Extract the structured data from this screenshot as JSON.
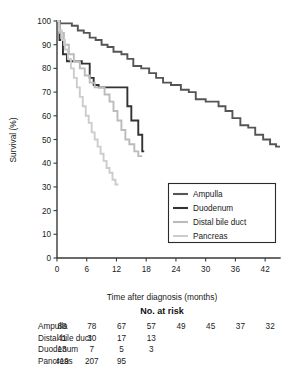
{
  "chart_data": {
    "type": "line",
    "title": "",
    "xlabel": "Time after diagnosis (months)",
    "ylabel": "Survival (%)",
    "xlim": [
      0,
      45
    ],
    "ylim": [
      0,
      100
    ],
    "xticks": [
      0,
      6,
      12,
      18,
      24,
      30,
      36,
      42
    ],
    "yticks": [
      0,
      10,
      20,
      30,
      40,
      50,
      60,
      70,
      80,
      90,
      100
    ],
    "grid": false,
    "legend_position": "center-right",
    "series": [
      {
        "name": "Ampulla",
        "color": "#555555",
        "points": [
          [
            0,
            100
          ],
          [
            0.6,
            100
          ],
          [
            0.6,
            99
          ],
          [
            3.0,
            99
          ],
          [
            3.0,
            98
          ],
          [
            4.2,
            98
          ],
          [
            4.2,
            96
          ],
          [
            5.4,
            96
          ],
          [
            5.4,
            95
          ],
          [
            6.6,
            95
          ],
          [
            6.6,
            93
          ],
          [
            7.8,
            93
          ],
          [
            7.8,
            92
          ],
          [
            9.0,
            92
          ],
          [
            9.0,
            90
          ],
          [
            10.2,
            90
          ],
          [
            10.2,
            89
          ],
          [
            11.4,
            89
          ],
          [
            11.4,
            87
          ],
          [
            13.0,
            87
          ],
          [
            13.0,
            86
          ],
          [
            14.2,
            86
          ],
          [
            14.2,
            84
          ],
          [
            15.4,
            84
          ],
          [
            15.4,
            81
          ],
          [
            17.0,
            81
          ],
          [
            17.0,
            80
          ],
          [
            18.6,
            80
          ],
          [
            18.6,
            78
          ],
          [
            20.0,
            78
          ],
          [
            20.0,
            76
          ],
          [
            21.4,
            76
          ],
          [
            21.4,
            74
          ],
          [
            23.0,
            74
          ],
          [
            23.0,
            73
          ],
          [
            25.0,
            73
          ],
          [
            25.0,
            71
          ],
          [
            26.6,
            71
          ],
          [
            26.6,
            70
          ],
          [
            28.0,
            70
          ],
          [
            28.0,
            67
          ],
          [
            30.0,
            67
          ],
          [
            30.0,
            66
          ],
          [
            32.6,
            66
          ],
          [
            32.6,
            64
          ],
          [
            34.0,
            64
          ],
          [
            34.0,
            62
          ],
          [
            35.4,
            62
          ],
          [
            35.4,
            59
          ],
          [
            37.0,
            59
          ],
          [
            37.0,
            56
          ],
          [
            38.6,
            56
          ],
          [
            38.6,
            55
          ],
          [
            40.0,
            55
          ],
          [
            40.0,
            52
          ],
          [
            41.6,
            52
          ],
          [
            41.6,
            50
          ],
          [
            43.0,
            50
          ],
          [
            43.0,
            48
          ],
          [
            44.2,
            48
          ],
          [
            44.2,
            47
          ],
          [
            45.0,
            47
          ]
        ]
      },
      {
        "name": "Duodenum",
        "color": "#333333",
        "points": [
          [
            0,
            100
          ],
          [
            0.5,
            100
          ],
          [
            0.5,
            92
          ],
          [
            1.2,
            92
          ],
          [
            1.2,
            86
          ],
          [
            2.0,
            86
          ],
          [
            2.0,
            83
          ],
          [
            5.0,
            83
          ],
          [
            5.0,
            82
          ],
          [
            6.6,
            82
          ],
          [
            6.6,
            76
          ],
          [
            7.4,
            76
          ],
          [
            7.4,
            73
          ],
          [
            8.4,
            73
          ],
          [
            8.4,
            72
          ],
          [
            14.2,
            72
          ],
          [
            14.2,
            64
          ],
          [
            15.0,
            64
          ],
          [
            15.0,
            58
          ],
          [
            16.4,
            58
          ],
          [
            16.4,
            52
          ],
          [
            17.2,
            52
          ],
          [
            17.2,
            45
          ],
          [
            17.6,
            45
          ]
        ]
      },
      {
        "name": "Distal bile duct",
        "color": "#bbbbbb",
        "points": [
          [
            0,
            100
          ],
          [
            0.5,
            100
          ],
          [
            0.5,
            95
          ],
          [
            1.4,
            95
          ],
          [
            1.4,
            90
          ],
          [
            2.4,
            90
          ],
          [
            2.4,
            86
          ],
          [
            3.4,
            86
          ],
          [
            3.4,
            83
          ],
          [
            4.6,
            83
          ],
          [
            4.6,
            80
          ],
          [
            5.6,
            80
          ],
          [
            5.6,
            77
          ],
          [
            6.6,
            77
          ],
          [
            6.6,
            74
          ],
          [
            7.6,
            74
          ],
          [
            7.6,
            72
          ],
          [
            9.6,
            72
          ],
          [
            9.6,
            69
          ],
          [
            10.6,
            69
          ],
          [
            10.6,
            66
          ],
          [
            11.4,
            66
          ],
          [
            11.4,
            62
          ],
          [
            12.2,
            62
          ],
          [
            12.2,
            58
          ],
          [
            13.0,
            58
          ],
          [
            13.0,
            54
          ],
          [
            13.8,
            54
          ],
          [
            13.8,
            50
          ],
          [
            14.6,
            50
          ],
          [
            14.6,
            48
          ],
          [
            15.6,
            48
          ],
          [
            15.6,
            45
          ],
          [
            16.4,
            45
          ],
          [
            16.4,
            43
          ],
          [
            17.2,
            43
          ]
        ]
      },
      {
        "name": "Pancreas",
        "color": "#cccccc",
        "points": [
          [
            0,
            100
          ],
          [
            0.4,
            100
          ],
          [
            0.4,
            96
          ],
          [
            1.0,
            96
          ],
          [
            1.0,
            92
          ],
          [
            1.6,
            92
          ],
          [
            1.6,
            88
          ],
          [
            2.2,
            88
          ],
          [
            2.2,
            84
          ],
          [
            2.8,
            84
          ],
          [
            2.8,
            80
          ],
          [
            3.4,
            80
          ],
          [
            3.4,
            76
          ],
          [
            4.0,
            76
          ],
          [
            4.0,
            72
          ],
          [
            4.6,
            72
          ],
          [
            4.6,
            68
          ],
          [
            5.2,
            68
          ],
          [
            5.2,
            64
          ],
          [
            5.8,
            64
          ],
          [
            5.8,
            60
          ],
          [
            6.4,
            60
          ],
          [
            6.4,
            57
          ],
          [
            7.0,
            57
          ],
          [
            7.0,
            53
          ],
          [
            7.6,
            53
          ],
          [
            7.6,
            50
          ],
          [
            8.2,
            50
          ],
          [
            8.2,
            47
          ],
          [
            8.8,
            47
          ],
          [
            8.8,
            44
          ],
          [
            9.4,
            44
          ],
          [
            9.4,
            41
          ],
          [
            10.0,
            41
          ],
          [
            10.0,
            38
          ],
          [
            10.6,
            38
          ],
          [
            10.6,
            36
          ],
          [
            11.2,
            36
          ],
          [
            11.2,
            33
          ],
          [
            11.8,
            33
          ],
          [
            11.8,
            31
          ],
          [
            12.4,
            31
          ]
        ]
      }
    ]
  },
  "legend": {
    "items": [
      {
        "label": "Ampulla",
        "color": "#555555"
      },
      {
        "label": "Duodenum",
        "color": "#333333"
      },
      {
        "label": "Distal bile duct",
        "color": "#bbbbbb"
      },
      {
        "label": "Pancreas",
        "color": "#cccccc"
      }
    ]
  },
  "risk_table": {
    "title": "No. at risk",
    "column_times": [
      0,
      6,
      12,
      18,
      24,
      30,
      36,
      42
    ],
    "rows": [
      {
        "label": "Ampulla",
        "values": [
          "88",
          "78",
          "67",
          "57",
          "49",
          "45",
          "37",
          "32"
        ]
      },
      {
        "label": "Distal bile duct",
        "values": [
          "41",
          "30",
          "17",
          "13",
          "",
          "",
          "",
          ""
        ]
      },
      {
        "label": "Duodenum",
        "values": [
          "13",
          "7",
          "5",
          "3",
          "",
          "",
          "",
          ""
        ]
      },
      {
        "label": "Pancreas",
        "values": [
          "419",
          "207",
          "95",
          "",
          "",
          "",
          "",
          ""
        ]
      }
    ]
  },
  "axis": {
    "ylabel": "Survival (%)",
    "xlabel": "Time after diagnosis (months)",
    "yticks": [
      "0",
      "10",
      "20",
      "30",
      "40",
      "50",
      "60",
      "70",
      "80",
      "90",
      "100"
    ],
    "xticks": [
      "0",
      "6",
      "12",
      "18",
      "24",
      "30",
      "36",
      "42"
    ]
  }
}
